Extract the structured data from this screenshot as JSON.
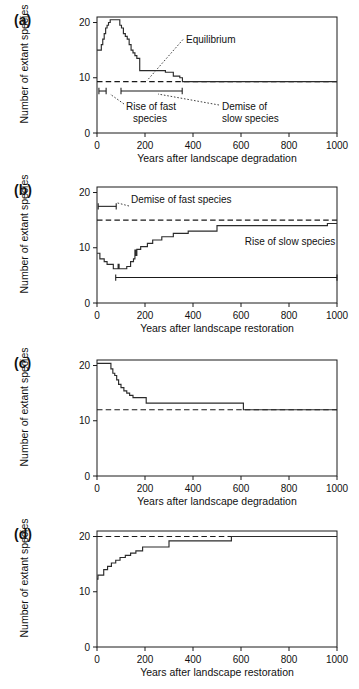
{
  "figure": {
    "type": "multi-panel-step-chart",
    "panel_count": 4,
    "background": "#ffffff",
    "line_color": "#2b2b2b"
  },
  "axis": {
    "y_label": "Number of extant species",
    "y_ticks": [
      "0",
      "10",
      "20"
    ],
    "y_tick_values": [
      0,
      10,
      20
    ],
    "ylim": [
      0,
      21
    ],
    "x_ticks": [
      "0",
      "200",
      "400",
      "600",
      "800",
      "1000"
    ],
    "x_tick_values": [
      0,
      200,
      400,
      600,
      800,
      1000
    ],
    "xlim": [
      0,
      1000
    ],
    "grid": "off",
    "legend": "none"
  },
  "panels": {
    "a": {
      "label": "(a)",
      "xlabel": "Years after landscape degradation",
      "equilibrium": 9.3,
      "annotations": [
        {
          "name": "equilibrium",
          "text": "Equilibrium"
        },
        {
          "name": "rise-of-fast-species",
          "text": "Rise of fast species",
          "line1": "Rise of fast",
          "line2": "species"
        },
        {
          "name": "demise-of-slow-species",
          "text": "Demise of slow species",
          "line1": "Demise of",
          "line2": "slow species"
        }
      ]
    },
    "b": {
      "label": "(b)",
      "xlabel": "Years after landscape restoration",
      "equilibrium": 15,
      "annotations": [
        {
          "name": "demise-of-fast-species",
          "text": "Demise of fast species"
        },
        {
          "name": "rise-of-slow-species",
          "text": "Rise of slow  species"
        }
      ]
    },
    "c": {
      "label": "(c)",
      "xlabel": "Years after landscape degradation",
      "equilibrium": 12,
      "annotations": []
    },
    "d": {
      "label": "(d)",
      "xlabel": "Years after landscape restoration",
      "equilibrium": 20,
      "annotations": []
    }
  },
  "chart_data": [
    {
      "id": "a",
      "type": "line",
      "title": "(a)",
      "xlabel": "Years after landscape degradation",
      "ylabel": "Number of extant species",
      "xlim": [
        0,
        1000
      ],
      "ylim": [
        0,
        21
      ],
      "grid": false,
      "legend": null,
      "step_style": "post",
      "equilibrium_line": 9.3,
      "equilibrium_label": "Equilibrium",
      "x": [
        0,
        12,
        18,
        24,
        30,
        36,
        42,
        48,
        55,
        62,
        70,
        88,
        95,
        102,
        110,
        118,
        126,
        134,
        142,
        150,
        158,
        166,
        178,
        210,
        250,
        285,
        300,
        318,
        330,
        345,
        356,
        1000
      ],
      "y": [
        15,
        15,
        16,
        17,
        18,
        19,
        19.5,
        20,
        20.5,
        20.5,
        20.5,
        20.5,
        19.5,
        19,
        18,
        17.5,
        17,
        16,
        15,
        14.5,
        14,
        13.5,
        11.3,
        11.3,
        11.3,
        11,
        11,
        10.3,
        10.3,
        10,
        9.3,
        9.3
      ],
      "annotation_bars": [
        {
          "name": "rise-of-fast-species",
          "x_start": 8,
          "x_end": 38,
          "y": 7.6
        },
        {
          "name": "demise-of-slow-species",
          "x_start": 100,
          "x_end": 355,
          "y": 7.6
        }
      ]
    },
    {
      "id": "b",
      "type": "line",
      "title": "(b)",
      "xlabel": "Years after landscape restoration",
      "ylabel": "Number of extant species",
      "xlim": [
        0,
        1000
      ],
      "ylim": [
        0,
        21
      ],
      "grid": false,
      "legend": null,
      "step_style": "post",
      "equilibrium_line": 15,
      "x": [
        0,
        5,
        12,
        20,
        30,
        42,
        55,
        68,
        78,
        88,
        92,
        98,
        110,
        124,
        140,
        152,
        158,
        162,
        166,
        172,
        182,
        196,
        210,
        232,
        252,
        270,
        292,
        318,
        342,
        380,
        430,
        470,
        500,
        560,
        700,
        860,
        960,
        1000
      ],
      "y": [
        9,
        9,
        8,
        8,
        7.5,
        7,
        7,
        6.2,
        6.2,
        7,
        6.2,
        6.2,
        6.2,
        6.6,
        7.5,
        8,
        9.6,
        8.6,
        9.7,
        9.7,
        10.2,
        10.2,
        10.8,
        11.4,
        11.4,
        12,
        12,
        12.6,
        12.6,
        13,
        13,
        13,
        14,
        14,
        14,
        14,
        14.4,
        14.4
      ],
      "annotation_bars": [
        {
          "name": "demise-of-fast-species",
          "x_start": 5,
          "x_end": 80,
          "y": 17.5
        },
        {
          "name": "rise-of-slow-species",
          "x_start": 78,
          "x_end": 1000,
          "y": 4.6
        }
      ]
    },
    {
      "id": "c",
      "type": "line",
      "title": "(c)",
      "xlabel": "Years after landscape degradation",
      "ylabel": "Number of extant species",
      "xlim": [
        0,
        1000
      ],
      "ylim": [
        0,
        21
      ],
      "grid": false,
      "legend": null,
      "step_style": "post",
      "equilibrium_line": 12,
      "x": [
        0,
        50,
        58,
        66,
        74,
        82,
        90,
        100,
        112,
        124,
        136,
        150,
        168,
        205,
        600,
        610,
        1000
      ],
      "y": [
        20.4,
        20.4,
        19.4,
        18.6,
        18.2,
        17.4,
        16.6,
        16.0,
        15.4,
        15.0,
        14.6,
        14.2,
        14.2,
        13.2,
        13.2,
        12,
        12
      ],
      "annotation_bars": []
    },
    {
      "id": "d",
      "type": "line",
      "title": "(d)",
      "xlabel": "Years after landscape restoration",
      "ylabel": "Number of extant species",
      "xlim": [
        0,
        1000
      ],
      "ylim": [
        0,
        21
      ],
      "grid": false,
      "legend": null,
      "step_style": "post",
      "equilibrium_line": 20,
      "x": [
        0,
        4,
        14,
        28,
        44,
        60,
        78,
        96,
        118,
        140,
        162,
        190,
        255,
        300,
        420,
        535,
        560,
        1000
      ],
      "y": [
        12.3,
        13,
        13,
        14,
        14.6,
        15.2,
        15.7,
        16.2,
        16.6,
        17,
        17.4,
        18.1,
        18.1,
        19.2,
        19.2,
        19.2,
        20,
        20
      ],
      "annotation_bars": []
    }
  ]
}
